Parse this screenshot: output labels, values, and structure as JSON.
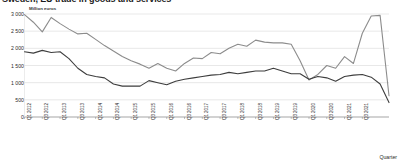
{
  "title": "Sweden, EU trade in goods and services",
  "axis": {
    "y_unit_label": "Million euros",
    "x_title": "Quarter",
    "y_ticks": [
      "3 000",
      "2 500",
      "2 000",
      "1 500",
      "1 000",
      "500",
      "0"
    ]
  },
  "chart_data": {
    "type": "line",
    "title": "Sweden, EU trade in goods and services",
    "xlabel": "Quarter",
    "ylabel": "Million euros",
    "ylim": [
      0,
      3000
    ],
    "grid": true,
    "legend": "none",
    "colors": {
      "series1": "#8c8c8c",
      "series2": "#3d3d3d",
      "grid": "#d0d0d0",
      "axis": "#808080"
    },
    "categories": [
      "Q1 2012",
      "Q2 2012",
      "Q3 2012",
      "Q4 2012",
      "Q1 2013",
      "Q2 2013",
      "Q3 2013",
      "Q4 2013",
      "Q1 2014",
      "Q2 2014",
      "Q3 2014",
      "Q4 2014",
      "Q1 2015",
      "Q2 2015",
      "Q3 2015",
      "Q4 2015",
      "Q1 2016",
      "Q2 2016",
      "Q3 2016",
      "Q4 2016",
      "Q1 2017",
      "Q2 2017",
      "Q3 2017",
      "Q4 2017",
      "Q1 2018",
      "Q2 2018",
      "Q3 2018",
      "Q4 2018",
      "Q1 2019",
      "Q2 2019",
      "Q3 2019",
      "Q4 2019",
      "Q1 2020",
      "Q2 2020",
      "Q3 2020",
      "Q4 2020",
      "Q1 2021",
      "Q2 2021",
      "Q3 2021",
      "Q4 2021",
      "Q1 2022",
      "Q2 2022"
    ],
    "tick_labels_shown": [
      "Q1 2012",
      "Q3 2012",
      "Q1 2013",
      "Q3 2013",
      "Q1 2014",
      "Q3 2014",
      "Q1 2015",
      "Q3 2015",
      "Q1 2016",
      "Q3 2016",
      "Q1 2017",
      "Q3 2017",
      "Q1 2018",
      "Q3 2018",
      "Q1 2019",
      "Q3 2019",
      "Q1 2020",
      "Q3 2020",
      "Q1 2021",
      "Q3 2021"
    ],
    "series": [
      {
        "name": "Exports",
        "color": "#8c8c8c",
        "values": [
          2980,
          2760,
          2480,
          2900,
          2720,
          2560,
          2420,
          2440,
          2260,
          2080,
          1920,
          1760,
          1640,
          1540,
          1420,
          1560,
          1420,
          1340,
          1560,
          1720,
          1700,
          1880,
          1840,
          2000,
          2120,
          2060,
          2240,
          2180,
          2160,
          2160,
          2120,
          1640,
          1080,
          1240,
          1500,
          1420,
          1760,
          1560,
          2440,
          2940,
          2960,
          620
        ]
      },
      {
        "name": "Imports",
        "color": "#3d3d3d",
        "values": [
          1900,
          1860,
          1940,
          1880,
          1900,
          1700,
          1420,
          1240,
          1180,
          1140,
          960,
          900,
          900,
          900,
          1060,
          1000,
          940,
          1040,
          1100,
          1140,
          1180,
          1220,
          1240,
          1300,
          1260,
          1300,
          1340,
          1340,
          1420,
          1340,
          1260,
          1260,
          1100,
          1180,
          1140,
          1040,
          1180,
          1220,
          1240,
          1160,
          960,
          420
        ]
      }
    ]
  }
}
